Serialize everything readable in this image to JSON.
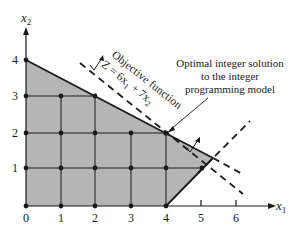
{
  "diagram": {
    "type": "integer-programming-graph",
    "axes": {
      "x_label": "x",
      "x_sub": "1",
      "y_label": "x",
      "y_sub": "2",
      "x_ticks": [
        "0",
        "1",
        "2",
        "3",
        "4",
        "5",
        "6"
      ],
      "y_ticks": [
        "1",
        "2",
        "3",
        "4"
      ]
    },
    "objective_label": {
      "line1": "Objective function",
      "line2_prefix": "Z = 6x",
      "line2_sub1": "1",
      "line2_mid": " + 7x",
      "line2_sub2": "2"
    },
    "annotation": {
      "line1": "Optimal integer solution",
      "line2": "to the integer",
      "line3": "programming model"
    },
    "colors": {
      "feasible_fill": "#b5b5b5",
      "line": "#1a1a1a",
      "background": "#ffffff"
    },
    "integer_points": [
      [
        0,
        0
      ],
      [
        1,
        0
      ],
      [
        2,
        0
      ],
      [
        3,
        0
      ],
      [
        4,
        0
      ],
      [
        0,
        1
      ],
      [
        1,
        1
      ],
      [
        2,
        1
      ],
      [
        3,
        1
      ],
      [
        4,
        1
      ],
      [
        5,
        1
      ],
      [
        0,
        2
      ],
      [
        1,
        2
      ],
      [
        2,
        2
      ],
      [
        3,
        2
      ],
      [
        4,
        2
      ],
      [
        0,
        3
      ],
      [
        1,
        3
      ],
      [
        2,
        3
      ],
      [
        0,
        4
      ]
    ],
    "optimal_point": [
      4,
      2
    ]
  }
}
